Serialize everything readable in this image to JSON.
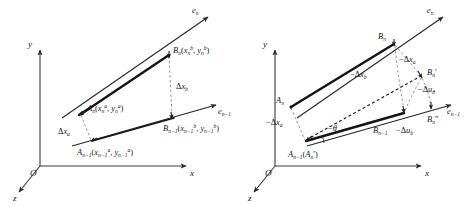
{
  "figure": {
    "background_color": "#ffffff",
    "line_color": "#161616",
    "dash_color": "#8c8c8c",
    "panels": [
      {
        "id": "left-panel",
        "name": "undeformed-configuration",
        "axes": {
          "y": "y",
          "x": "x",
          "z": "z",
          "origin": "O",
          "e_n": "e",
          "e_n_sub": "n",
          "e_nm1": "e",
          "e_nm1_sub": "n−1"
        },
        "points": [
          {
            "name": "B_n",
            "base": "B",
            "sub": "n",
            "coords_open": "(",
            "x_sym": "x",
            "x_sub": "n",
            "x_sup": "b",
            "comma": ", ",
            "y_sym": "y",
            "y_sub": "n",
            "y_sup": "b",
            "coords_close": ")"
          },
          {
            "name": "A_n",
            "base": "A",
            "sub": "n",
            "coords_open": "(",
            "x_sym": "x",
            "x_sub": "n",
            "x_sup": "a",
            "comma": ", ",
            "y_sym": "y",
            "y_sub": "n",
            "y_sup": "a",
            "coords_close": ")"
          },
          {
            "name": "B_n-1",
            "base": "B",
            "sub": "n−1",
            "coords_open": "(",
            "x_sym": "x",
            "x_sub": "n−1",
            "x_sup": "b",
            "comma": ", ",
            "y_sym": "y",
            "y_sub": "n−1",
            "y_sup": "b",
            "coords_close": ")"
          },
          {
            "name": "A_n-1",
            "base": "A",
            "sub": "n−1",
            "coords_open": "(",
            "x_sym": "x",
            "x_sub": "n−1",
            "x_sup": "a",
            "comma": ", ",
            "y_sym": "y",
            "y_sub": "n−1",
            "y_sup": "a",
            "coords_close": ")"
          }
        ],
        "deltas": [
          {
            "name": "delta-x-b",
            "sym": "Δ",
            "var": "x",
            "sub": "b"
          },
          {
            "name": "delta-x-a",
            "sym": "Δ",
            "var": "x",
            "sub": "a"
          }
        ]
      },
      {
        "id": "right-panel",
        "name": "deformed-configuration",
        "axes": {
          "y": "y",
          "x": "x",
          "z": "z",
          "origin": "O",
          "e_n": "e",
          "e_n_sub": "n",
          "e_nm1": "e",
          "e_nm1_sub": "n−1"
        },
        "points": [
          {
            "name": "B_n",
            "base": "B",
            "sub": "n",
            "prime": ""
          },
          {
            "name": "A_n",
            "base": "A",
            "sub": "n",
            "prime": ""
          },
          {
            "name": "B_n-prime",
            "base": "B",
            "sub": "n",
            "prime": "′"
          },
          {
            "name": "B_n-double-prime",
            "base": "B",
            "sub": "n",
            "prime": "″"
          },
          {
            "name": "B_n-1",
            "base": "B",
            "sub": "n−1",
            "prime": ""
          },
          {
            "name": "A_n-1-A_n-prime",
            "base": "A",
            "sub": "n−1",
            "paren_open": "(",
            "inner_base": "A",
            "inner_sub": "n",
            "inner_prime": "′",
            "paren_close": ")"
          }
        ],
        "deltas": [
          {
            "name": "neg-delta-x-a-top",
            "sym": "−Δ",
            "var": "x",
            "sub": "a"
          },
          {
            "name": "neg-delta-x-b",
            "sym": "−Δ",
            "var": "x",
            "sub": "b"
          },
          {
            "name": "neg-delta-u-theta",
            "sym": "−Δ",
            "var": "u",
            "sub": "θ"
          },
          {
            "name": "neg-delta-x-a-left",
            "sym": "−Δ",
            "var": "x",
            "sub": "a"
          },
          {
            "name": "neg-delta-u-b",
            "sym": "−Δ",
            "var": "u",
            "sub": "b"
          }
        ],
        "angle": {
          "name": "neg-theta",
          "label": "−θ"
        }
      }
    ]
  }
}
